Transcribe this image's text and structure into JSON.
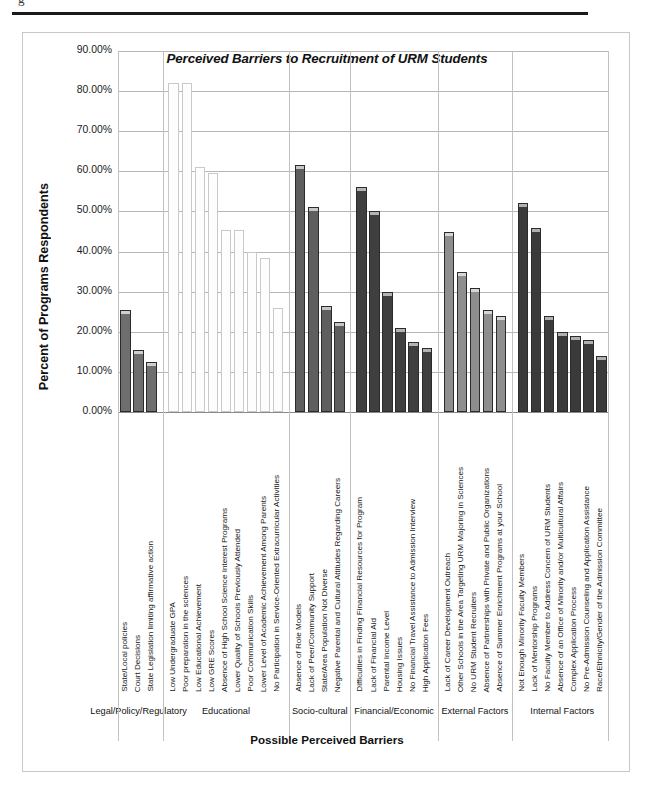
{
  "page": {
    "crop_glyph": "g",
    "chart_frame_name": "chart-container"
  },
  "chart_data": {
    "type": "bar",
    "title": "Perceived Barriers to Recruitment of URM Students",
    "xlabel": "Possible Perceived Barriers",
    "ylabel": "Percent of Programs Respondents",
    "ylim": [
      0,
      90
    ],
    "ytick_labels": [
      "90.00%",
      "80.00%",
      "70.00%",
      "60.00%",
      "50.00%",
      "40.00%",
      "30.00%",
      "20.00%",
      "10.00%",
      "0.00%"
    ],
    "ytick_values": [
      90,
      80,
      70,
      60,
      50,
      40,
      30,
      20,
      10,
      0
    ],
    "grid": true,
    "legend": "none",
    "groups": [
      {
        "name": "Legal/Policy/Regulatory",
        "fill": "#6e6e6e",
        "cap": "#cfcfcf",
        "categories": [
          "State/Local policies",
          "Court Decisions",
          "State Legislation limiting affirmative action"
        ],
        "values": [
          25.5,
          15.5,
          12.5
        ]
      },
      {
        "name": "Educational",
        "fill": "#fdfdfd",
        "cap": "#ffffff",
        "categories": [
          "Low Undergraduate GPA",
          "Poor preparation in the sciences",
          "Low Educational Achievement",
          "Low GRE Scores",
          "Absence of High School Science Interest Programs",
          "Lower Quality of Schools Previously Attended",
          "Poor Communication Skills",
          "Lower Level of Academic Achievement Among Parents",
          "No Participation in Service-Oriented Extracurricular Activities"
        ],
        "values": [
          82.0,
          82.0,
          61.0,
          59.5,
          45.5,
          45.5,
          40.0,
          38.5,
          26.0
        ]
      },
      {
        "name": "Socio-cultural",
        "fill": "#5e5e5e",
        "cap": "#c6c6c6",
        "categories": [
          "Absence of Role Models",
          "Lack of Peer/Community Support",
          "State/Area Population Not Diverse",
          "Negative Parental and Cultural Attitudes Regarding Careers"
        ],
        "values": [
          61.5,
          51.0,
          26.5,
          22.5
        ]
      },
      {
        "name": "Financial/Economic",
        "fill": "#3f3f3f",
        "cap": "#b4b4b4",
        "categories": [
          "Difficulties in Finding Financial Resources for Program",
          "Lack of Financial Aid",
          "Parental Income Level",
          "Housing Issues",
          "No Financial Travel Assistance to Admission Interview",
          "High Application Fees"
        ],
        "values": [
          56.0,
          50.0,
          30.0,
          21.0,
          17.5,
          16.0
        ]
      },
      {
        "name": "External Factors",
        "fill": "#8e8e8e",
        "cap": "#d6d6d6",
        "categories": [
          "Lack of Career Development Outreach",
          "Other Schools in the Area Targeting URM Majoring in Sciences",
          "No URM Student Recruiters",
          "Absence of Partnerships with Private and Public Organizations",
          "Absence of Summer Enrichment Programs at your School"
        ],
        "values": [
          45.0,
          35.0,
          31.0,
          25.5,
          24.0
        ]
      },
      {
        "name": "Internal Factors",
        "fill": "#3a3a3a",
        "cap": "#b0b0b0",
        "categories": [
          "Not Enough Minority Faculty Members",
          "Lack of Mentorship Programs",
          "No Faculty Member to Address Concern of URM Students",
          "Absence of an Office of Minority and/or Multicultural Affairs",
          "Complex Application Process",
          "No Pre-Admission Counseling and Application Assistance",
          "Race/Ethnicity/Gender of the Admission Committee"
        ],
        "values": [
          52.0,
          46.0,
          24.0,
          20.0,
          19.0,
          18.0,
          14.0
        ]
      }
    ]
  }
}
